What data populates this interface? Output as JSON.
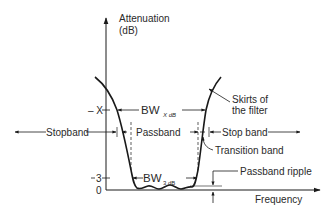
{
  "diagram": {
    "type": "bandpass filter attenuation response",
    "axes": {
      "y_label_line1": "Attenuation",
      "y_label_line2": "(dB)",
      "x_label": "Frequency",
      "y_ticks": [
        {
          "label": "– X",
          "meaning": "X dB"
        },
        {
          "label": "3",
          "meaning": "3 dB"
        },
        {
          "label": "0",
          "meaning": "0 dB"
        }
      ]
    },
    "labels": {
      "bw_x": "BW",
      "bw_x_sub": "X dB",
      "bw_3": "BW",
      "bw_3_sub": "3 dB",
      "stopband_left": "Stopband",
      "passband": "Passband",
      "stopband_right": "Stop band",
      "transition_band": "Transition band",
      "passband_ripple": "Passband ripple",
      "skirts_line1": "Skirts of",
      "skirts_line2": "the filter"
    },
    "colors": {
      "line": "#1a1a1a",
      "text": "#2a2a2a",
      "background": "#ffffff"
    }
  }
}
